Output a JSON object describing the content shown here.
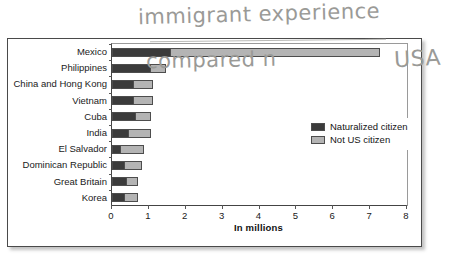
{
  "annotation": {
    "line1": "immigrant experience",
    "line2": "compared n",
    "line3": "USA"
  },
  "legend": {
    "items": [
      {
        "label": "Naturalized citizen",
        "color": "#3b3b3b"
      },
      {
        "label": "Not US citizen",
        "color": "#b4b4b4"
      }
    ]
  },
  "chart_data": {
    "type": "bar",
    "orientation": "horizontal",
    "stacked": true,
    "title": "",
    "xlabel": "In millions",
    "ylabel": "",
    "xlim": [
      0,
      8
    ],
    "xticks": [
      "0",
      "1",
      "2",
      "3",
      "4",
      "5",
      "6",
      "7",
      "8"
    ],
    "grid": false,
    "legend_position": "inside-right",
    "categories": [
      "Mexico",
      "Philippines",
      "China and Hong Kong",
      "Vietnam",
      "Cuba",
      "India",
      "El Salvador",
      "Dominican Republic",
      "Great Britain",
      "Korea"
    ],
    "series": [
      {
        "name": "Naturalized citizen",
        "color": "#3b3b3b",
        "values": [
          1.55,
          1.0,
          0.55,
          0.55,
          0.6,
          0.4,
          0.2,
          0.3,
          0.35,
          0.3
        ]
      },
      {
        "name": "Not US citizen",
        "color": "#b4b4b4",
        "values": [
          5.65,
          0.4,
          0.5,
          0.5,
          0.4,
          0.6,
          0.6,
          0.45,
          0.3,
          0.35
        ]
      }
    ],
    "totals": [
      7.2,
      1.4,
      1.05,
      1.05,
      1.0,
      1.0,
      0.8,
      0.75,
      0.65,
      0.65
    ]
  }
}
